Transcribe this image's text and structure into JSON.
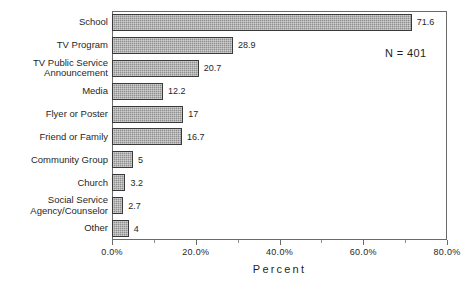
{
  "chart_data": {
    "type": "bar",
    "orientation": "horizontal",
    "title": "",
    "xlabel": "Percent",
    "ylabel": "",
    "xlim": [
      0.0,
      80.0
    ],
    "grid": false,
    "legend": null,
    "tick_labels": [
      "0.0%",
      "20.0%",
      "40.0%",
      "60.0%",
      "80.0%"
    ],
    "tick_values": [
      0,
      20,
      40,
      60,
      80
    ],
    "minor_tick_values": [
      10,
      30,
      50,
      70
    ],
    "annotation": "N = 401",
    "categories": [
      "School",
      "TV Program",
      "TV Public Service\nAnnouncement",
      "Media",
      "Flyer or Poster",
      "Friend or Family",
      "Community Group",
      "Church",
      "Social Service\nAgency/Counselor",
      "Other"
    ],
    "values": [
      71.6,
      28.9,
      20.7,
      12.2,
      17,
      16.7,
      5,
      3.2,
      2.7,
      4
    ],
    "value_labels": [
      "71.6",
      "28.9",
      "20.7",
      "12.2",
      "17",
      "16.7",
      "5",
      "3.2",
      "2.7",
      "4"
    ],
    "bar_fill_color": "#8f8f8f",
    "bar_border_color": "#3a3a3a",
    "axis_color": "#6b6b6b",
    "text_color": "#1f1f1f"
  }
}
